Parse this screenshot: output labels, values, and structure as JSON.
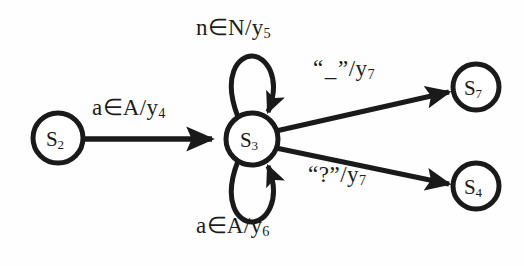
{
  "diagram": {
    "type": "finite-state-machine",
    "title": "",
    "background_color": "#fefefe",
    "stroke_color": "#1a1a1a",
    "states": [
      {
        "id": "s2",
        "label": "S",
        "subscript": "2",
        "cx": 58,
        "cy": 138,
        "r": 25
      },
      {
        "id": "s3",
        "label": "S",
        "subscript": "3",
        "cx": 252,
        "cy": 139,
        "r": 26
      },
      {
        "id": "s7",
        "label": "S",
        "subscript": "7",
        "cx": 476,
        "cy": 87,
        "r": 23
      },
      {
        "id": "s4",
        "label": "S",
        "subscript": "4",
        "cx": 476,
        "cy": 186,
        "r": 23
      }
    ],
    "transitions": [
      {
        "id": "t-entry",
        "from": "s2",
        "to": "s3",
        "input": "a∈A",
        "output": "y",
        "output_subscript": "4",
        "label_text": "a∈A/y₄",
        "kind": "straight"
      },
      {
        "id": "t-loop-top",
        "from": "s3",
        "to": "s3",
        "input": "n∈N",
        "output": "y",
        "output_subscript": "5",
        "label_text": "n∈N/y₅",
        "kind": "self-loop-up"
      },
      {
        "id": "t-loop-bottom",
        "from": "s3",
        "to": "s3",
        "input": "a∈A",
        "output": "y",
        "output_subscript": "6",
        "label_text": "a∈A/y₆",
        "kind": "self-loop-down"
      },
      {
        "id": "t-branch-up",
        "from": "s3",
        "to": "s7",
        "input": "“_”",
        "output": "y",
        "output_subscript": "7",
        "label_prefix": "“",
        "label_char": "_",
        "label_suffix": "”/y",
        "label_text": "“_”/y₇",
        "kind": "straight"
      },
      {
        "id": "t-branch-down",
        "from": "s3",
        "to": "s4",
        "input": "“?”",
        "output": "y",
        "output_subscript": "7",
        "label_text": "“?”/y₇",
        "kind": "straight"
      }
    ],
    "labels": {
      "loop_top": {
        "input": "n∈N",
        "slash": "/",
        "output": "y",
        "sub": "5"
      },
      "loop_bottom": {
        "input": "a∈A",
        "slash": "/",
        "output": "y",
        "sub": "6"
      },
      "entry": {
        "input": "a∈A",
        "slash": "/",
        "output": "y",
        "sub": "4"
      },
      "branch_up": {
        "open_quote": "“",
        "symbol": "_",
        "close_quote": "”",
        "slash": "/",
        "output": "y",
        "sub": "7"
      },
      "branch_down": {
        "open_quote": "“",
        "symbol": "?",
        "close_quote": "”",
        "slash": "/",
        "output": "y",
        "sub": "7"
      }
    }
  }
}
